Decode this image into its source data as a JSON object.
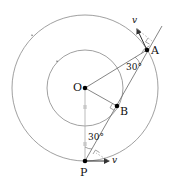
{
  "diagram": {
    "type": "geometry-circular-motion",
    "colors": {
      "circle": "#888888",
      "line": "#555555",
      "point": "#000000",
      "text": "#111111",
      "tick": "#aaaaaa"
    },
    "points": {
      "O": {
        "label": "O",
        "x": 85,
        "y": 88
      },
      "A": {
        "label": "A",
        "x": 147,
        "y": 50
      },
      "B": {
        "label": "B",
        "x": 117,
        "y": 106
      },
      "P": {
        "label": "P",
        "x": 85,
        "y": 161
      }
    },
    "circles": [
      {
        "name": "outer",
        "cx": 85,
        "cy": 88,
        "r": 73
      },
      {
        "name": "inner",
        "cx": 85,
        "cy": 88,
        "r": 38
      }
    ],
    "angles": [
      {
        "label": "30°",
        "at": "A"
      },
      {
        "label": "30°",
        "at": "P"
      }
    ],
    "velocity_labels": [
      {
        "label": "v",
        "at": "A"
      },
      {
        "label": "v",
        "at": "P"
      }
    ]
  }
}
